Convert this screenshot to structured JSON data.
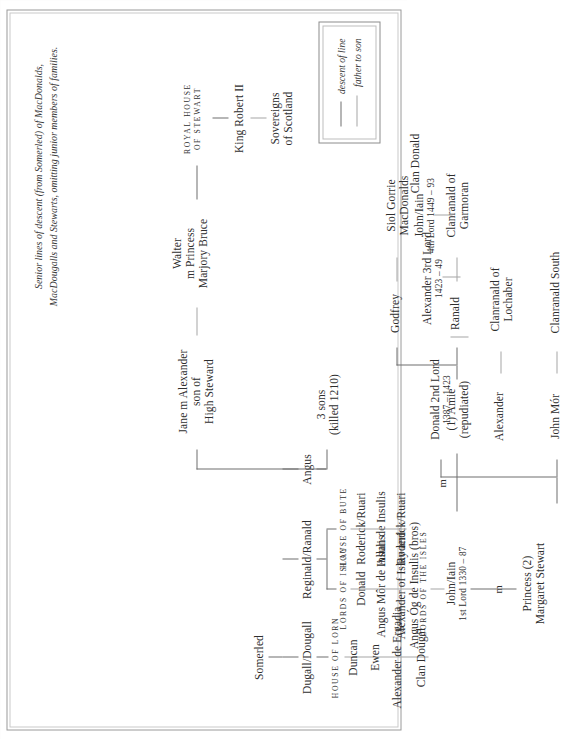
{
  "caption": {
    "lines": [
      "Senior lines of descent (from Somerled) of MacDonalds,",
      "MacDougalls and Stewarts, omitting junior members of families."
    ]
  },
  "legend": {
    "items": [
      {
        "label": "descent of line",
        "style": "descent"
      },
      {
        "label": "father to son",
        "style": "father"
      }
    ]
  },
  "headings": {
    "house_of_lorn": "HOUSE OF LORN",
    "lords_of_islay": "LORDS OF ISLAY",
    "lords_of_the_isles": "LORDS OF THE ISLES",
    "house_of_bute": "HOUSE OF BUTE",
    "royal_house_of_stewart": "ROYAL HOUSE\nOF STEWART"
  },
  "marriage_marks": {
    "m_islay": "m",
    "m_lorn": "m"
  },
  "nodes": {
    "somerled": "Somerled",
    "dugall": "Dugall/Dougall",
    "reginald": "Reginald/Ranald",
    "angus": "Angus",
    "duncan": "Duncan",
    "ewen": "Ewen",
    "alexander_de_ergadia": "Alexander de Ergadia",
    "clan_dougal": "Clan Dougal",
    "donald": "Donald",
    "angus_mor": "Angus Môr de Insulis",
    "alexander_and_angus_og_l1": "Alexander of Islay and",
    "alexander_and_angus_og_l2": "Angus Óg de Insulis (bros)",
    "roderick_ruari_1": "Roderick/Ruari",
    "allan_de_insulis": "Allan de Insulis",
    "roderick_ruari_2": "Roderick/Ruari",
    "three_sons_l1": "3 sons",
    "three_sons_l2": "(killed 1210)",
    "jane_l1": "Jane m Alexander",
    "jane_l2": "son of",
    "jane_l3": "High Steward",
    "walter_l1": "Walter",
    "walter_l2": "m Princess",
    "walter_l3": "Marjory Bruce",
    "king_robert_ii": "King Robert II",
    "sovereigns_l1": "Sovereigns",
    "sovereigns_l2": "of Scotland",
    "john_iain_l1": "John/Iain",
    "john_iain_l2": "1st Lord 1330 – 87",
    "amie_l1": "(1) Amie",
    "amie_l2": "(repudiated)",
    "princess_l1": "Princess (2)",
    "princess_l2": "Margaret Stewart",
    "ranald": "Ranald",
    "godfrey": "Godfrey",
    "clanranald_garmoran_l1": "Clanranald of",
    "clanranald_garmoran_l2": "Garmoran",
    "siol_gorrie_l1": "Siol Gorrie",
    "siol_gorrie_l2": "MacDonalds",
    "alexander": "Alexander",
    "clanranald_lochaber_l1": "Clanranald of",
    "clanranald_lochaber_l2": "Lochaber",
    "john_mor": "John Mór",
    "clanranald_south": "Clanranald South",
    "donald_2nd_l1": "Donald 2nd Lord",
    "donald_2nd_l2": "1387 – 1423",
    "alexander_3rd_l1": "Alexander 3rd Lord",
    "alexander_3rd_l2": "1423 – 49",
    "john_iain_4th_l1": "John/Iain",
    "john_iain_4th_l2": "4th Lord 1449 – 93",
    "clan_donald": "Clan Donald"
  },
  "colors": {
    "ink": "#2e2e2e",
    "line_descent": "#6f6f6f",
    "line_father": "#a5a5a5",
    "frame": "#9a9a9a",
    "paper": "#ffffff"
  }
}
